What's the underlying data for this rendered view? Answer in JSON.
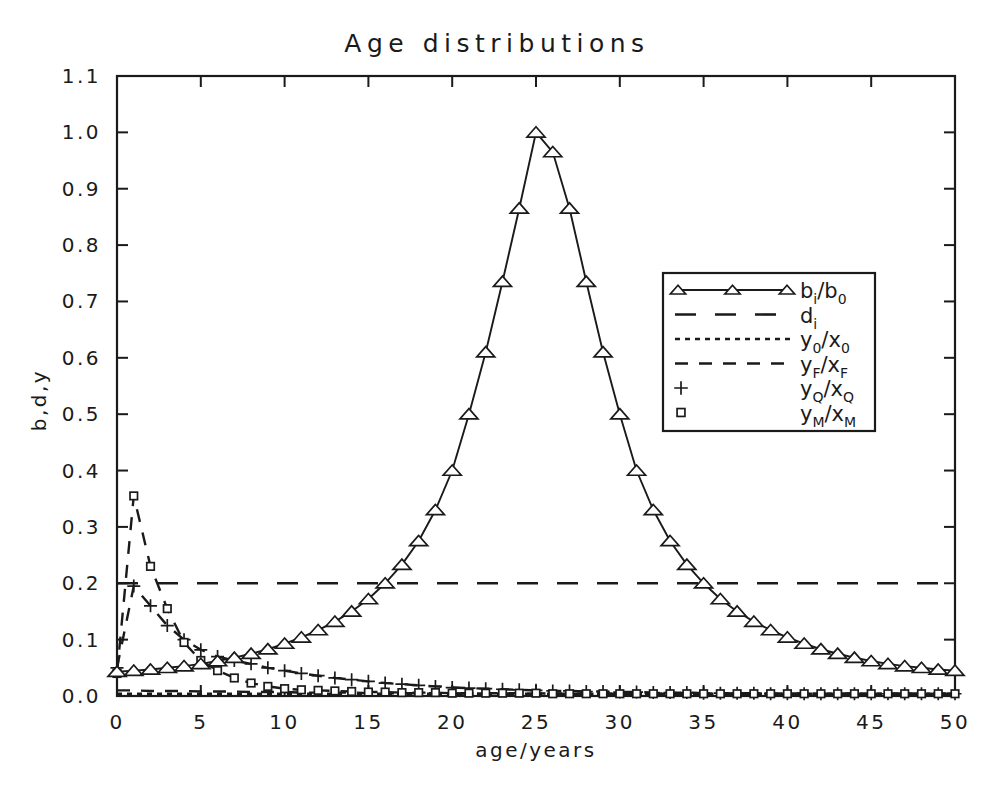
{
  "chart_data": {
    "type": "line",
    "title": "Age distributions",
    "xlabel": "age/years",
    "ylabel": "b,d,y",
    "xlim": [
      0,
      50
    ],
    "ylim": [
      0.0,
      1.1
    ],
    "xticks": [
      0,
      5,
      10,
      15,
      20,
      25,
      30,
      35,
      40,
      45,
      50
    ],
    "xtick_labels": [
      "0",
      "5",
      "10",
      "15",
      "20",
      "25",
      "30",
      "35",
      "40",
      "45",
      "50"
    ],
    "yticks": [
      0.0,
      0.1,
      0.2,
      0.3,
      0.4,
      0.5,
      0.6,
      0.7,
      0.8,
      0.9,
      1.0,
      1.1
    ],
    "ytick_labels": [
      "0.0",
      "0.1",
      "0.2",
      "0.3",
      "0.4",
      "0.5",
      "0.6",
      "0.7",
      "0.8",
      "0.9",
      "1.0",
      "1.1"
    ],
    "grid": false,
    "legend_position": "center-right",
    "x": [
      0,
      1,
      2,
      3,
      4,
      5,
      6,
      7,
      8,
      9,
      10,
      11,
      12,
      13,
      14,
      15,
      16,
      17,
      18,
      19,
      20,
      21,
      22,
      23,
      24,
      25,
      26,
      27,
      28,
      29,
      30,
      31,
      32,
      33,
      34,
      35,
      36,
      37,
      38,
      39,
      40,
      41,
      42,
      43,
      44,
      45,
      46,
      47,
      48,
      49,
      50
    ],
    "series": [
      {
        "name": "b_i/b_0",
        "label_main": "b",
        "label_sub1": "i",
        "label_main2": "/b",
        "label_sub2": "0",
        "style": "solid",
        "marker": "triangle",
        "values": [
          0.043,
          0.045,
          0.047,
          0.05,
          0.053,
          0.057,
          0.062,
          0.068,
          0.075,
          0.083,
          0.093,
          0.104,
          0.117,
          0.132,
          0.15,
          0.172,
          0.2,
          0.233,
          0.275,
          0.33,
          0.4,
          0.5,
          0.61,
          0.735,
          0.865,
          1.0,
          0.965,
          0.865,
          0.735,
          0.61,
          0.5,
          0.4,
          0.33,
          0.275,
          0.233,
          0.2,
          0.172,
          0.15,
          0.132,
          0.117,
          0.104,
          0.093,
          0.083,
          0.075,
          0.068,
          0.062,
          0.057,
          0.053,
          0.05,
          0.047,
          0.045
        ]
      },
      {
        "name": "d_i",
        "label_main": "d",
        "label_sub1": "i",
        "label_main2": "",
        "label_sub2": "",
        "style": "longdash",
        "marker": "none",
        "values": [
          0.2,
          0.2,
          0.2,
          0.2,
          0.2,
          0.2,
          0.2,
          0.2,
          0.2,
          0.2,
          0.2,
          0.2,
          0.2,
          0.2,
          0.2,
          0.2,
          0.2,
          0.2,
          0.2,
          0.2,
          0.2,
          0.2,
          0.2,
          0.2,
          0.2,
          0.2,
          0.2,
          0.2,
          0.2,
          0.2,
          0.2,
          0.2,
          0.2,
          0.2,
          0.2,
          0.2,
          0.2,
          0.2,
          0.2,
          0.2,
          0.2,
          0.2,
          0.2,
          0.2,
          0.2,
          0.2,
          0.2,
          0.2,
          0.2,
          0.2,
          0.2
        ]
      },
      {
        "name": "y_0/x_0",
        "label_main": "y",
        "label_sub1": "0",
        "label_main2": "/x",
        "label_sub2": "0",
        "style": "dotted",
        "marker": "none",
        "values": [
          0.004,
          0.004,
          0.004,
          0.004,
          0.004,
          0.004,
          0.004,
          0.004,
          0.004,
          0.004,
          0.004,
          0.004,
          0.004,
          0.004,
          0.004,
          0.004,
          0.004,
          0.004,
          0.004,
          0.004,
          0.004,
          0.004,
          0.004,
          0.004,
          0.004,
          0.004,
          0.004,
          0.004,
          0.004,
          0.004,
          0.004,
          0.004,
          0.004,
          0.004,
          0.004,
          0.004,
          0.004,
          0.004,
          0.004,
          0.004,
          0.004,
          0.004,
          0.004,
          0.004,
          0.004,
          0.004,
          0.004,
          0.004,
          0.004,
          0.004,
          0.004
        ]
      },
      {
        "name": "y_F/x_F",
        "label_main": "y",
        "label_sub1": "F",
        "label_main2": "/x",
        "label_sub2": "F",
        "style": "dashed",
        "marker": "none",
        "values": [
          0.01,
          0.01,
          0.009,
          0.009,
          0.009,
          0.008,
          0.008,
          0.008,
          0.007,
          0.007,
          0.007,
          0.006,
          0.006,
          0.006,
          0.006,
          0.005,
          0.005,
          0.005,
          0.005,
          0.005,
          0.005,
          0.004,
          0.004,
          0.004,
          0.004,
          0.004,
          0.004,
          0.004,
          0.004,
          0.004,
          0.004,
          0.004,
          0.004,
          0.004,
          0.004,
          0.004,
          0.004,
          0.004,
          0.004,
          0.004,
          0.004,
          0.004,
          0.004,
          0.004,
          0.004,
          0.004,
          0.004,
          0.004,
          0.004,
          0.004,
          0.004
        ]
      },
      {
        "name": "y_Q/x_Q",
        "label_main": "y",
        "label_sub1": "Q",
        "label_main2": "/x",
        "label_sub2": "Q",
        "style": "dashed",
        "marker": "plus",
        "values": [
          0.05,
          0.195,
          0.16,
          0.125,
          0.1,
          0.082,
          0.07,
          0.063,
          0.057,
          0.05,
          0.045,
          0.04,
          0.036,
          0.032,
          0.029,
          0.026,
          0.023,
          0.021,
          0.019,
          0.017,
          0.015,
          0.014,
          0.013,
          0.012,
          0.011,
          0.01,
          0.009,
          0.009,
          0.008,
          0.008,
          0.007,
          0.007,
          0.006,
          0.006,
          0.006,
          0.005,
          0.005,
          0.005,
          0.005,
          0.004,
          0.004,
          0.004,
          0.004,
          0.004,
          0.004,
          0.004,
          0.004,
          0.004,
          0.004,
          0.004,
          0.004
        ]
      },
      {
        "name": "y_M/x_M",
        "label_main": "y",
        "label_sub1": "M",
        "label_main2": "/x",
        "label_sub2": "M",
        "style": "dashed",
        "marker": "square",
        "values": [
          0.04,
          0.355,
          0.23,
          0.155,
          0.095,
          0.063,
          0.045,
          0.032,
          0.023,
          0.017,
          0.013,
          0.011,
          0.01,
          0.009,
          0.008,
          0.007,
          0.007,
          0.006,
          0.006,
          0.006,
          0.005,
          0.005,
          0.005,
          0.005,
          0.005,
          0.005,
          0.004,
          0.004,
          0.004,
          0.004,
          0.004,
          0.004,
          0.004,
          0.004,
          0.004,
          0.004,
          0.004,
          0.004,
          0.004,
          0.004,
          0.004,
          0.004,
          0.004,
          0.004,
          0.004,
          0.004,
          0.004,
          0.004,
          0.004,
          0.004,
          0.004
        ]
      }
    ]
  },
  "colors": {
    "ink": "#1a1a1a",
    "background": "#ffffff"
  }
}
